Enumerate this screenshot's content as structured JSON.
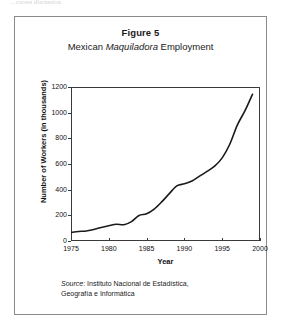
{
  "page": {
    "top_cut_text": "…rocess discussion"
  },
  "figure": {
    "label": "Figure 5",
    "subtitle_pre": "Mexican ",
    "subtitle_italic": "Maquiladora",
    "subtitle_post": " Employment",
    "source_label": "Source",
    "source_text": ": Instituto Nacional de Estadística,",
    "source_text_line2": "Geografía e Informática"
  },
  "chart_data": {
    "type": "line",
    "title": "Figure 5",
    "subtitle": "Mexican Maquiladora Employment",
    "xlabel": "Year",
    "ylabel": "Number of Workers (in thousands)",
    "xlim": [
      1975,
      2000
    ],
    "ylim": [
      0,
      1200
    ],
    "xticks": [
      1975,
      1980,
      1985,
      1990,
      1995,
      2000
    ],
    "ytick_labels": [
      "0",
      "200",
      "400",
      "600",
      "800",
      "1000",
      "1200"
    ],
    "yticks": [
      0,
      200,
      400,
      600,
      800,
      1000,
      1200
    ],
    "grid": false,
    "legend": "none",
    "series": [
      {
        "name": "Maquiladora employment",
        "color": "#1a1a1a",
        "x": [
          1975,
          1976,
          1977,
          1978,
          1979,
          1980,
          1981,
          1982,
          1983,
          1984,
          1985,
          1986,
          1987,
          1988,
          1989,
          1990,
          1991,
          1992,
          1993,
          1994,
          1995,
          1996,
          1997,
          1998,
          1999
        ],
        "values": [
          67,
          74,
          78,
          90,
          105,
          119,
          131,
          127,
          151,
          199,
          212,
          249,
          305,
          369,
          429,
          446,
          467,
          505,
          542,
          583,
          648,
          754,
          903,
          1014,
          1143
        ]
      }
    ]
  }
}
